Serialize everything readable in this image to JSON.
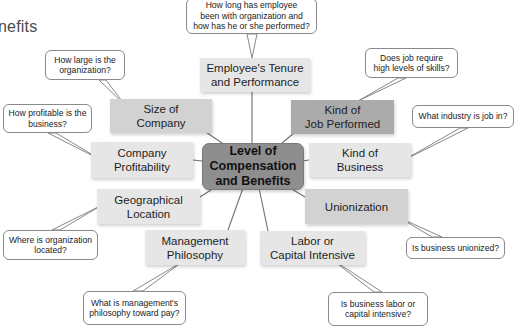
{
  "diagram": {
    "title_fragment": "nefits",
    "center": {
      "label": "Level of Compensation and Benefits",
      "lines": [
        "Level of",
        "Compensation",
        "and Benefits"
      ]
    },
    "factors": [
      {
        "id": "tenure",
        "lines": [
          "Employee's Tenure",
          "and Performance"
        ],
        "question": [
          "How long has employee",
          "been with organization and",
          "how has he or she performed?"
        ]
      },
      {
        "id": "size",
        "lines": [
          "Size of",
          "Company"
        ],
        "question": [
          "How large is the",
          "organization?"
        ]
      },
      {
        "id": "job",
        "lines": [
          "Kind of",
          "Job Performed"
        ],
        "question": [
          "Does job require",
          "high levels of skills?"
        ]
      },
      {
        "id": "profitability",
        "lines": [
          "Company",
          "Profitability"
        ],
        "question": [
          "How profitable is the",
          "business?"
        ]
      },
      {
        "id": "business",
        "lines": [
          "Kind of",
          "Business"
        ],
        "question": [
          "What industry is job in?"
        ]
      },
      {
        "id": "location",
        "lines": [
          "Geographical",
          "Location"
        ],
        "question": [
          "Where is organization",
          "located?"
        ]
      },
      {
        "id": "union",
        "lines": [
          "Unionization"
        ],
        "question": [
          "Is business unionized?"
        ]
      },
      {
        "id": "management",
        "lines": [
          "Management",
          "Philosophy"
        ],
        "question": [
          "What is management's",
          "philosophy toward pay?"
        ]
      },
      {
        "id": "labor",
        "lines": [
          "Labor or",
          "Capital Intensive"
        ],
        "question": [
          "Is business labor or",
          "capital intensive?"
        ]
      }
    ],
    "colors": {
      "center": "#8e8e8e",
      "dark_box": "#ababab",
      "mid_box": "#d2d2d2",
      "light_box": "#e6e6e6",
      "line": "#777777",
      "bubble_border": "#8a8a8a"
    }
  }
}
